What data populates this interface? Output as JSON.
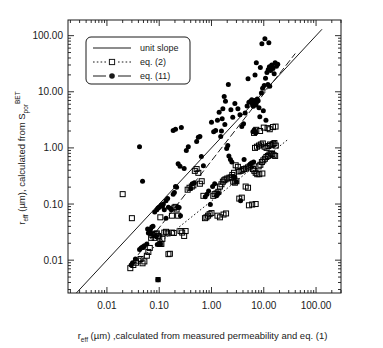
{
  "chart_data": {
    "type": "scatter",
    "title": "",
    "xlabel": "r_eff (µm) ,calculated from measured permeability and eq. (1)",
    "ylabel": "r_eff (µm), calculated from S_por^BET",
    "xlabel_parts": {
      "base": "r",
      "sub": "eff",
      "rest": " (µm) ,calculated from measured permeability and eq. (1)"
    },
    "ylabel_parts": {
      "base": "r",
      "sub": "eff",
      "mid": " (µm), calculated from S",
      "sub2": "por",
      "sup2": "BET"
    },
    "xscale": "log",
    "yscale": "log",
    "xlim": [
      0.0018,
      300
    ],
    "ylim": [
      0.0026,
      190
    ],
    "grid": false,
    "xticks": [
      0.01,
      0.1,
      1,
      10,
      100
    ],
    "xticklabels": [
      "0.01",
      "0.10",
      "1.00",
      "10.00",
      "100.00"
    ],
    "yticks": [
      0.01,
      0.1,
      1,
      10,
      100
    ],
    "yticklabels": [
      "0.01",
      "0.10",
      "1.00",
      "10.00",
      "100.00"
    ],
    "minor_ticks": true,
    "legend": {
      "position": "upper-left",
      "entries": [
        {
          "label": "unit slope",
          "marker": "none",
          "line": "solid"
        },
        {
          "label": "eq. (2)",
          "marker": "open-square",
          "line": "dotted"
        },
        {
          "label": "eq. (11)",
          "marker": "filled-circle",
          "line": "dashed"
        }
      ]
    },
    "reference_lines": [
      {
        "name": "unit-slope",
        "style": "solid",
        "x": [
          0.0026,
          130
        ],
        "y": [
          0.0026,
          130
        ]
      },
      {
        "name": "eq-11-fit",
        "style": "dashed",
        "x": [
          0.03,
          40
        ],
        "y": [
          0.009,
          48
        ]
      },
      {
        "name": "eq-2-fit",
        "style": "dotted",
        "x": [
          0.03,
          30
        ],
        "y": [
          0.0082,
          1.45
        ]
      }
    ],
    "series": [
      {
        "name": "eq. (11)",
        "marker": "filled-circle",
        "color": "#000000",
        "points": [
          [
            0.029,
            0.0082
          ],
          [
            0.031,
            0.009
          ],
          [
            0.035,
            0.0105
          ],
          [
            0.042,
            0.0155
          ],
          [
            0.045,
            0.0165
          ],
          [
            0.048,
            0.0172
          ],
          [
            0.05,
            0.0168
          ],
          [
            0.052,
            0.018
          ],
          [
            0.058,
            0.0195
          ],
          [
            0.062,
            0.0305
          ],
          [
            0.065,
            0.033
          ],
          [
            0.068,
            0.0355
          ],
          [
            0.07,
            0.03
          ],
          [
            0.072,
            0.039
          ],
          [
            0.076,
            0.04
          ],
          [
            0.06,
            0.036
          ],
          [
            0.088,
            0.0265
          ],
          [
            0.092,
            0.019
          ],
          [
            0.105,
            0.0195
          ],
          [
            0.082,
            0.072
          ],
          [
            0.09,
            0.079
          ],
          [
            0.095,
            0.085
          ],
          [
            0.1,
            0.088
          ],
          [
            0.11,
            0.096
          ],
          [
            0.115,
            0.091
          ],
          [
            0.12,
            0.1
          ],
          [
            0.125,
            0.079
          ],
          [
            0.135,
            0.115
          ],
          [
            0.145,
            0.125
          ],
          [
            0.15,
            0.088
          ],
          [
            0.165,
            0.083
          ],
          [
            0.17,
            0.079
          ],
          [
            0.185,
            0.15
          ],
          [
            0.195,
            0.16
          ],
          [
            0.205,
            0.205
          ],
          [
            0.215,
            0.2
          ],
          [
            0.225,
            0.088
          ],
          [
            0.24,
            0.087
          ],
          [
            0.255,
            0.062
          ],
          [
            0.135,
            0.056
          ],
          [
            0.042,
            1.05
          ],
          [
            0.048,
            0.255
          ],
          [
            0.185,
            2.05
          ],
          [
            0.205,
            2.15
          ],
          [
            0.265,
            2.3
          ],
          [
            0.23,
            0.52
          ],
          [
            0.25,
            0.47
          ],
          [
            0.3,
            0.43
          ],
          [
            0.33,
            0.9
          ],
          [
            0.36,
            1.05
          ],
          [
            0.4,
            0.19
          ],
          [
            0.43,
            0.23
          ],
          [
            0.47,
            0.24
          ],
          [
            0.52,
            1.3
          ],
          [
            0.56,
            1.55
          ],
          [
            0.6,
            1.6
          ],
          [
            0.64,
            0.7
          ],
          [
            0.7,
            0.48
          ],
          [
            0.76,
            0.135
          ],
          [
            0.82,
            0.15
          ],
          [
            0.88,
            0.17
          ],
          [
            0.95,
            0.098
          ],
          [
            1.05,
            0.205
          ],
          [
            1.15,
            0.23
          ],
          [
            1.0,
            2.85
          ],
          [
            1.1,
            1.95
          ],
          [
            1.2,
            2.05
          ],
          [
            1.3,
            3.1
          ],
          [
            1.4,
            4.3
          ],
          [
            1.5,
            1.6
          ],
          [
            1.55,
            2.0
          ],
          [
            1.65,
            5.0
          ],
          [
            1.75,
            8.2
          ],
          [
            1.8,
            2.6
          ],
          [
            1.95,
            0.98
          ],
          [
            2.05,
            1.1
          ],
          [
            2.15,
            0.72
          ],
          [
            2.3,
            0.62
          ],
          [
            2.45,
            0.56
          ],
          [
            2.6,
            0.31
          ],
          [
            2.8,
            0.3
          ],
          [
            3.0,
            0.25
          ],
          [
            1.6,
            3.3
          ],
          [
            1.85,
            6.8
          ],
          [
            2.1,
            13.5
          ],
          [
            2.35,
            4.8
          ],
          [
            2.55,
            3.5
          ],
          [
            2.8,
            6.2
          ],
          [
            3.2,
            5.0
          ],
          [
            3.5,
            3.9
          ],
          [
            3.8,
            2.4
          ],
          [
            4.1,
            2.7
          ],
          [
            4.4,
            4.2
          ],
          [
            4.8,
            5.6
          ],
          [
            5.2,
            6.5
          ],
          [
            5.6,
            6.8
          ],
          [
            5.9,
            7.2
          ],
          [
            6.1,
            6.0
          ],
          [
            6.3,
            5.5
          ],
          [
            6.5,
            6.2
          ],
          [
            6.7,
            7.0
          ],
          [
            6.9,
            6.4
          ],
          [
            7.1,
            5.8
          ],
          [
            7.3,
            6.6
          ],
          [
            7.5,
            7.4
          ],
          [
            7.8,
            6.9
          ],
          [
            8.1,
            5.2
          ],
          [
            8.4,
            3.6
          ],
          [
            6.2,
            1.95
          ],
          [
            6.6,
            2.1
          ],
          [
            7.0,
            1.85
          ],
          [
            5.5,
            0.51
          ],
          [
            5.8,
            0.54
          ],
          [
            6.4,
            0.56
          ],
          [
            9.0,
            9.5
          ],
          [
            9.5,
            11.5
          ],
          [
            10.2,
            13.0
          ],
          [
            10.8,
            17.5
          ],
          [
            11.5,
            22.0
          ],
          [
            12.2,
            25.0
          ],
          [
            12.8,
            28.0
          ],
          [
            13.5,
            24.0
          ],
          [
            14.2,
            30.0
          ],
          [
            15.0,
            26.0
          ],
          [
            15.8,
            21.0
          ],
          [
            16.5,
            33.0
          ],
          [
            17.5,
            28.5
          ],
          [
            18.5,
            31.0
          ],
          [
            9.8,
            4.6
          ],
          [
            11.0,
            3.1
          ],
          [
            12.0,
            13.5
          ],
          [
            13.0,
            12.5
          ],
          [
            8.6,
            27.0
          ],
          [
            9.2,
            72.0
          ],
          [
            10.5,
            88.0
          ],
          [
            12.5,
            75.0
          ],
          [
            7.2,
            33.0
          ],
          [
            6.8,
            20.0
          ],
          [
            5.0,
            17.0
          ],
          [
            4.2,
            0.62
          ],
          [
            3.6,
            0.115
          ],
          [
            1.25,
            0.14
          ],
          [
            1.35,
            0.155
          ],
          [
            0.095,
            0.0045
          ]
        ]
      },
      {
        "name": "eq. (2)",
        "marker": "open-square",
        "color": "#000000",
        "points": [
          [
            0.028,
            0.0072
          ],
          [
            0.032,
            0.0082
          ],
          [
            0.036,
            0.009
          ],
          [
            0.04,
            0.0098
          ],
          [
            0.044,
            0.0105
          ],
          [
            0.048,
            0.0088
          ],
          [
            0.052,
            0.0095
          ],
          [
            0.058,
            0.012
          ],
          [
            0.062,
            0.014
          ],
          [
            0.066,
            0.0165
          ],
          [
            0.07,
            0.025
          ],
          [
            0.074,
            0.028
          ],
          [
            0.078,
            0.0295
          ],
          [
            0.082,
            0.025
          ],
          [
            0.086,
            0.029
          ],
          [
            0.09,
            0.03
          ],
          [
            0.095,
            0.027
          ],
          [
            0.1,
            0.0255
          ],
          [
            0.105,
            0.0195
          ],
          [
            0.11,
            0.0195
          ],
          [
            0.115,
            0.024
          ],
          [
            0.125,
            0.031
          ],
          [
            0.135,
            0.032
          ],
          [
            0.145,
            0.03
          ],
          [
            0.15,
            0.0128
          ],
          [
            0.16,
            0.013
          ],
          [
            0.175,
            0.031
          ],
          [
            0.19,
            0.0305
          ],
          [
            0.02,
            0.15
          ],
          [
            0.03,
            0.056
          ],
          [
            0.105,
            0.058
          ],
          [
            0.175,
            0.062
          ],
          [
            0.195,
            0.086
          ],
          [
            0.205,
            0.089
          ],
          [
            0.215,
            0.08
          ],
          [
            0.23,
            0.062
          ],
          [
            0.255,
            0.033
          ],
          [
            0.275,
            0.031
          ],
          [
            0.3,
            0.027
          ],
          [
            0.32,
            0.033
          ],
          [
            0.35,
            0.18
          ],
          [
            0.38,
            0.195
          ],
          [
            0.42,
            0.205
          ],
          [
            0.45,
            0.215
          ],
          [
            0.48,
            0.39
          ],
          [
            0.52,
            0.42
          ],
          [
            0.56,
            0.36
          ],
          [
            0.6,
            0.23
          ],
          [
            0.65,
            0.255
          ],
          [
            0.7,
            0.14
          ],
          [
            0.75,
            0.056
          ],
          [
            0.8,
            0.058
          ],
          [
            0.86,
            0.062
          ],
          [
            0.92,
            0.066
          ],
          [
            1.0,
            0.069
          ],
          [
            1.08,
            0.14
          ],
          [
            1.15,
            0.15
          ],
          [
            1.25,
            0.155
          ],
          [
            1.35,
            0.165
          ],
          [
            1.45,
            0.205
          ],
          [
            1.55,
            0.225
          ],
          [
            1.65,
            0.25
          ],
          [
            1.75,
            0.265
          ],
          [
            1.85,
            0.275
          ],
          [
            2.0,
            0.285
          ],
          [
            2.2,
            0.295
          ],
          [
            2.4,
            0.3
          ],
          [
            2.6,
            0.25
          ],
          [
            2.8,
            0.24
          ],
          [
            3.0,
            0.255
          ],
          [
            3.3,
            0.38
          ],
          [
            3.6,
            0.39
          ],
          [
            3.9,
            0.4
          ],
          [
            4.2,
            0.42
          ],
          [
            4.6,
            0.43
          ],
          [
            5.0,
            0.45
          ],
          [
            5.4,
            0.47
          ],
          [
            5.8,
            0.495
          ],
          [
            6.2,
            0.42
          ],
          [
            6.6,
            0.39
          ],
          [
            7.0,
            0.36
          ],
          [
            7.5,
            0.34
          ],
          [
            8.0,
            0.47
          ],
          [
            8.6,
            0.5
          ],
          [
            9.2,
            0.56
          ],
          [
            9.8,
            0.6
          ],
          [
            10.5,
            0.64
          ],
          [
            11.2,
            0.69
          ],
          [
            12.0,
            0.72
          ],
          [
            12.8,
            0.76
          ],
          [
            13.6,
            0.8
          ],
          [
            14.5,
            0.78
          ],
          [
            15.5,
            0.74
          ],
          [
            16.5,
            0.72
          ],
          [
            6.8,
            1.0
          ],
          [
            7.4,
            1.05
          ],
          [
            8.1,
            1.1
          ],
          [
            8.8,
            1.15
          ],
          [
            9.6,
            1.2
          ],
          [
            10.4,
            1.05
          ],
          [
            11.3,
            1.0
          ],
          [
            12.2,
            1.08
          ],
          [
            13.2,
            1.15
          ],
          [
            14.2,
            1.12
          ],
          [
            15.2,
            1.18
          ],
          [
            16.0,
            1.22
          ],
          [
            17.0,
            1.1
          ],
          [
            6.5,
            1.85
          ],
          [
            7.2,
            2.1
          ],
          [
            8.5,
            2.0
          ],
          [
            10.0,
            2.3
          ],
          [
            11.8,
            2.25
          ],
          [
            13.0,
            2.15
          ],
          [
            15.0,
            2.35
          ],
          [
            16.8,
            2.4
          ],
          [
            5.2,
            0.095
          ],
          [
            6.0,
            0.098
          ],
          [
            7.0,
            0.1
          ],
          [
            8.2,
            0.34
          ],
          [
            9.4,
            0.35
          ],
          [
            4.5,
            0.205
          ],
          [
            5.0,
            0.195
          ],
          [
            3.8,
            0.13
          ],
          [
            3.4,
            0.125
          ],
          [
            2.9,
            0.49
          ],
          [
            3.2,
            0.46
          ],
          [
            2.5,
            0.33
          ],
          [
            2.7,
            0.36
          ],
          [
            1.3,
            0.062
          ],
          [
            1.45,
            0.058
          ],
          [
            1.7,
            0.065
          ],
          [
            1.9,
            0.068
          ]
        ]
      }
    ]
  },
  "plot_geometry": {
    "left": 68,
    "right": 341,
    "top": 20,
    "bottom": 293
  }
}
